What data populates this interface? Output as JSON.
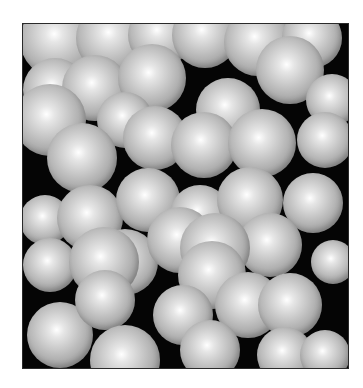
{
  "image": {
    "subject": "close-packed shaded spheres",
    "background_color": "#050505",
    "page_color": "#ffffff",
    "sphere_highlight": "#ffffff",
    "sphere_mid": "#c8c8c8",
    "sphere_edge": "#747474",
    "frame": {
      "left": 23,
      "top": 24,
      "width": 325,
      "height": 344
    },
    "spheres": [
      [
        58,
        40,
        38
      ],
      [
        112,
        38,
        36
      ],
      [
        160,
        35,
        32
      ],
      [
        205,
        35,
        33
      ],
      [
        258,
        42,
        34
      ],
      [
        312,
        38,
        30
      ],
      [
        55,
        90,
        32
      ],
      [
        95,
        88,
        33
      ],
      [
        152,
        78,
        34
      ],
      [
        290,
        70,
        34
      ],
      [
        332,
        100,
        26
      ],
      [
        228,
        110,
        32
      ],
      [
        125,
        120,
        28
      ],
      [
        50,
        120,
        36
      ],
      [
        82,
        158,
        35
      ],
      [
        155,
        138,
        32
      ],
      [
        204,
        145,
        33
      ],
      [
        262,
        143,
        34
      ],
      [
        325,
        140,
        28
      ],
      [
        45,
        220,
        25
      ],
      [
        90,
        218,
        33
      ],
      [
        148,
        200,
        32
      ],
      [
        200,
        215,
        30
      ],
      [
        250,
        200,
        33
      ],
      [
        313,
        203,
        30
      ],
      [
        50,
        265,
        27
      ],
      [
        125,
        262,
        33
      ],
      [
        180,
        240,
        33
      ],
      [
        270,
        245,
        32
      ],
      [
        333,
        262,
        22
      ],
      [
        104,
        262,
        35
      ],
      [
        215,
        248,
        35
      ],
      [
        212,
        275,
        34
      ],
      [
        248,
        305,
        33
      ],
      [
        290,
        305,
        32
      ],
      [
        60,
        335,
        33
      ],
      [
        105,
        300,
        30
      ],
      [
        183,
        315,
        30
      ],
      [
        125,
        360,
        35
      ],
      [
        210,
        350,
        30
      ],
      [
        285,
        355,
        28
      ],
      [
        325,
        355,
        25
      ]
    ]
  }
}
